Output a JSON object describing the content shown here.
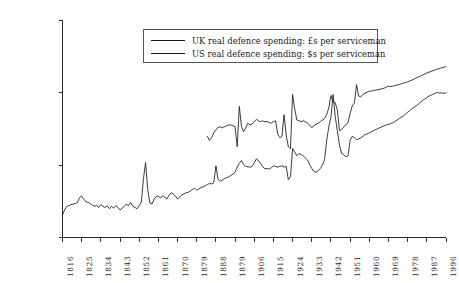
{
  "chart_data": {
    "type": "line",
    "title": "",
    "xlabel": "",
    "ylabel": "",
    "scale": "log",
    "grid": false,
    "ylim": [
      1000,
      1000000
    ],
    "xlim": [
      1816,
      1996
    ],
    "y_ticks": [
      "1000",
      "10000",
      "100000",
      "1000000"
    ],
    "y_tick_values": [
      1000,
      10000,
      100000,
      1000000
    ],
    "x_ticks": [
      "1816",
      "1825",
      "1834",
      "1843",
      "1852",
      "1861",
      "1870",
      "1879",
      "1888",
      "1879",
      "1906",
      "1915",
      "1924",
      "1933",
      "1942",
      "1951",
      "1960",
      "1969",
      "1978",
      "1987",
      "1996"
    ],
    "x_tick_values": [
      1816,
      1825,
      1834,
      1843,
      1852,
      1861,
      1870,
      1879,
      1888,
      1897,
      1906,
      1915,
      1924,
      1933,
      1942,
      1951,
      1960,
      1969,
      1978,
      1987,
      1996
    ],
    "legend_position": "top-center",
    "legend": [
      {
        "name": "UK real defence spending: £s per serviceman",
        "color": "#141414"
      },
      {
        "name": "US real defence spending: $s per serviceman",
        "color": "#141414"
      }
    ],
    "series": [
      {
        "name": "UK real defence spending: £s per serviceman",
        "color": "#141414",
        "x": [
          1816,
          1817,
          1818,
          1819,
          1820,
          1821,
          1822,
          1823,
          1824,
          1825,
          1826,
          1827,
          1828,
          1829,
          1830,
          1831,
          1832,
          1833,
          1834,
          1835,
          1836,
          1837,
          1838,
          1839,
          1840,
          1841,
          1842,
          1843,
          1844,
          1845,
          1846,
          1847,
          1848,
          1849,
          1850,
          1851,
          1852,
          1853,
          1854,
          1855,
          1856,
          1857,
          1858,
          1859,
          1860,
          1861,
          1862,
          1863,
          1864,
          1865,
          1866,
          1867,
          1868,
          1869,
          1870,
          1871,
          1872,
          1873,
          1874,
          1875,
          1876,
          1877,
          1878,
          1879,
          1880,
          1881,
          1882,
          1883,
          1884,
          1885,
          1886,
          1887,
          1888,
          1889,
          1890,
          1891,
          1892,
          1893,
          1894,
          1895,
          1896,
          1897,
          1898,
          1899,
          1900,
          1901,
          1902,
          1903,
          1904,
          1905,
          1906,
          1907,
          1908,
          1909,
          1910,
          1911,
          1912,
          1913,
          1914,
          1915,
          1916,
          1917,
          1918,
          1919,
          1920,
          1921,
          1922,
          1923,
          1924,
          1925,
          1926,
          1927,
          1928,
          1929,
          1930,
          1931,
          1932,
          1933,
          1934,
          1935,
          1936,
          1937,
          1938,
          1939,
          1940,
          1941,
          1942,
          1943,
          1944,
          1945,
          1946,
          1947,
          1948,
          1949,
          1950,
          1951,
          1952,
          1953,
          1954,
          1955,
          1956,
          1957,
          1958,
          1959,
          1960,
          1961,
          1962,
          1963,
          1964,
          1965,
          1966,
          1967,
          1968,
          1969,
          1970,
          1971,
          1972,
          1973,
          1974,
          1975,
          1976,
          1977,
          1978,
          1979,
          1980,
          1981,
          1982,
          1983,
          1984,
          1985,
          1986,
          1987,
          1988,
          1989,
          1990,
          1991,
          1992,
          1993,
          1994,
          1995,
          1996
        ],
        "y": [
          2050,
          2400,
          2700,
          2750,
          2850,
          2900,
          2950,
          3050,
          3550,
          3750,
          3350,
          3150,
          3050,
          2950,
          2800,
          2700,
          2780,
          2600,
          2850,
          2700,
          2600,
          2750,
          2500,
          2700,
          2550,
          2750,
          2600,
          2400,
          2550,
          2700,
          2900,
          2750,
          3050,
          2700,
          2600,
          2500,
          2750,
          3100,
          6500,
          10900,
          4600,
          3000,
          2900,
          3400,
          3700,
          3750,
          3500,
          3800,
          3600,
          3400,
          3850,
          4150,
          4000,
          3750,
          3400,
          3600,
          3900,
          4000,
          4150,
          4200,
          4400,
          4600,
          4800,
          4500,
          4700,
          4900,
          5000,
          5200,
          5400,
          5600,
          5500,
          5700,
          9800,
          6400,
          6000,
          6200,
          6500,
          6700,
          6900,
          7200,
          7500,
          8000,
          9400,
          10600,
          11600,
          10200,
          9600,
          9500,
          9400,
          9600,
          10800,
          12200,
          11600,
          10500,
          9500,
          8900,
          9000,
          8800,
          9200,
          9800,
          9600,
          9400,
          9600,
          9800,
          9400,
          9600,
          6300,
          6900,
          17000,
          15200,
          13500,
          14500,
          14000,
          13500,
          12600,
          11800,
          10200,
          9000,
          8200,
          8000,
          8400,
          9000,
          10000,
          12000,
          22000,
          34000,
          46000,
          95000,
          47000,
          30000,
          19000,
          14500,
          14000,
          13000,
          13500,
          22000,
          25000,
          24000,
          22500,
          23000,
          24000,
          25000,
          26500,
          27000,
          28000,
          29000,
          30000,
          31000,
          32000,
          33000,
          34000,
          35000,
          36000,
          36500,
          37500,
          38500,
          40000,
          42000,
          44000,
          46000,
          48000,
          51000,
          54000,
          57000,
          60000,
          63000,
          66000,
          70000,
          74000,
          78000,
          82000,
          86000,
          90000,
          93000,
          96000,
          99000,
          101000,
          99000,
          100000,
          98000,
          101000
        ]
      },
      {
        "name": "US real defence spending: $s per serviceman",
        "color": "#141414",
        "x": [
          1884,
          1885,
          1886,
          1887,
          1888,
          1889,
          1890,
          1891,
          1892,
          1893,
          1894,
          1895,
          1896,
          1897,
          1898,
          1899,
          1900,
          1901,
          1902,
          1903,
          1904,
          1905,
          1906,
          1907,
          1908,
          1909,
          1910,
          1911,
          1912,
          1913,
          1914,
          1915,
          1916,
          1917,
          1918,
          1919,
          1920,
          1921,
          1922,
          1923,
          1924,
          1925,
          1926,
          1927,
          1928,
          1929,
          1930,
          1931,
          1932,
          1933,
          1934,
          1935,
          1936,
          1937,
          1938,
          1939,
          1940,
          1941,
          1942,
          1943,
          1944,
          1945,
          1946,
          1947,
          1948,
          1949,
          1950,
          1951,
          1952,
          1953,
          1954,
          1955,
          1956,
          1957,
          1958,
          1959,
          1960,
          1961,
          1962,
          1963,
          1964,
          1965,
          1966,
          1967,
          1968,
          1969,
          1970,
          1971,
          1972,
          1973,
          1974,
          1975,
          1976,
          1977,
          1978,
          1979,
          1980,
          1981,
          1982,
          1983,
          1984,
          1985,
          1986,
          1987,
          1988,
          1989,
          1990,
          1991,
          1992,
          1993,
          1994,
          1995,
          1996
        ],
        "y": [
          25000,
          22000,
          24000,
          28000,
          31000,
          33000,
          34000,
          33000,
          34000,
          35000,
          36000,
          36000,
          35000,
          34000,
          18000,
          65000,
          34000,
          29000,
          33000,
          38000,
          36000,
          37000,
          40000,
          43000,
          41000,
          40000,
          41000,
          40000,
          40000,
          39000,
          38000,
          40000,
          41000,
          27000,
          24000,
          25000,
          50000,
          26000,
          18000,
          17000,
          95000,
          60000,
          42000,
          41000,
          40000,
          41000,
          40000,
          38000,
          36000,
          33000,
          35000,
          37000,
          38000,
          40000,
          42000,
          44000,
          50000,
          62000,
          92000,
          75000,
          73000,
          58000,
          30000,
          31000,
          34000,
          36000,
          39000,
          52000,
          66000,
          72000,
          130000,
          90000,
          88000,
          95000,
          99000,
          102000,
          105000,
          106000,
          108000,
          109000,
          110000,
          112000,
          114000,
          116000,
          120000,
          124000,
          122000,
          124000,
          126000,
          128000,
          130000,
          133000,
          136000,
          139000,
          142000,
          146000,
          150000,
          155000,
          160000,
          165000,
          170000,
          176000,
          182000,
          188000,
          193000,
          198000,
          203000,
          208000,
          213000,
          218000,
          222000,
          226000,
          230000
        ]
      }
    ]
  }
}
